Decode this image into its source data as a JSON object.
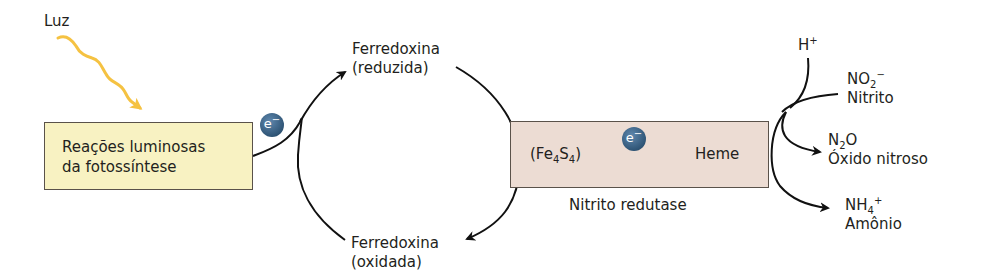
{
  "light": {
    "label": "Luz",
    "color": "#f5c242"
  },
  "light_reactions_box": {
    "line1": "Reações luminosas",
    "line2": "da fotossíntese",
    "fill": "#f8f2c2"
  },
  "electron_badge": {
    "symbol": "e",
    "charge": "−",
    "color": "#2f5576"
  },
  "ferredoxin_reduced": {
    "line1": "Ferredoxina",
    "line2": "(reduzida)"
  },
  "ferredoxin_oxidized": {
    "line1": "Ferredoxina",
    "line2": "(oxidada)"
  },
  "enzyme_box": {
    "donor": {
      "prefix": "(Fe",
      "sub1": "4",
      "mid": "S",
      "sub2": "4",
      "suffix": ")"
    },
    "acceptor": "Heme",
    "name": "Nitrito redutase",
    "fill": "#ecdcd3"
  },
  "reactions": {
    "proton": {
      "base": "H",
      "sup": "+"
    },
    "nitrite": {
      "base": "NO",
      "sub": "2",
      "sup": "−",
      "name": "Nitrito"
    },
    "nitrous_oxide": {
      "pre": "N",
      "sub": "2",
      "post": "O",
      "name": "Óxido nitroso"
    },
    "ammonium": {
      "base": "NH",
      "sub": "4",
      "sup": "+",
      "name": "Amônio"
    }
  }
}
